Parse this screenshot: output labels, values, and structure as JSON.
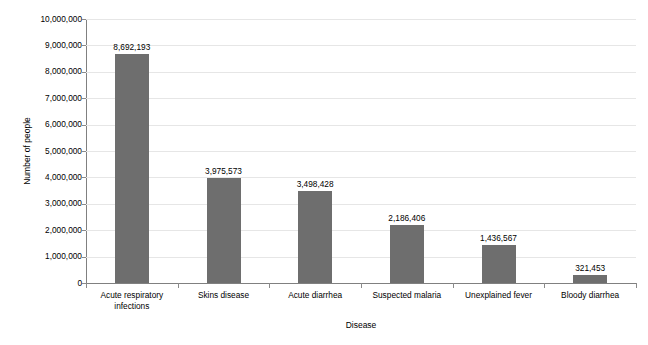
{
  "chart_data": {
    "type": "bar",
    "title": "",
    "xlabel": "Disease",
    "ylabel": "Number of people",
    "categories": [
      "Acute respiratory\ninfections",
      "Skins disease",
      "Acute diarrhea",
      "Suspected malaria",
      "Unexplained fever",
      "Bloody diarrhea"
    ],
    "values": [
      8692193,
      3975573,
      3498428,
      2186406,
      1436567,
      321453
    ],
    "value_labels": [
      "8,692,193",
      "3,975,573",
      "3,498,428",
      "2,186,406",
      "1,436,567",
      "321,453"
    ],
    "ylim": [
      0,
      10000000
    ],
    "ytick_step": 1000000,
    "ytick_labels": [
      "0",
      "1,000,000",
      "2,000,000",
      "3,000,000",
      "4,000,000",
      "5,000,000",
      "6,000,000",
      "7,000,000",
      "8,000,000",
      "9,000,000",
      "10,000,000"
    ],
    "grid": true,
    "grid_axis": "y",
    "legend": false,
    "legend_position": "none",
    "bar_color": "#6e6e6e",
    "grid_color": "#e6e6e6",
    "axis_color": "#808080",
    "text_color": "#000000",
    "background_color": "#ffffff"
  }
}
